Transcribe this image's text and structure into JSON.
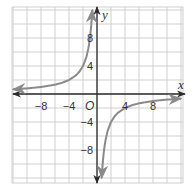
{
  "chart_data": {
    "type": "line",
    "title": "",
    "xlabel": "x",
    "ylabel": "y",
    "origin_label": "O",
    "xlim": [
      -12,
      12.3
    ],
    "ylim": [
      -12.7,
      12.4
    ],
    "grid": true,
    "grid_step": 2,
    "x_ticks": [
      -8,
      -4,
      4,
      8
    ],
    "y_ticks": [
      8,
      4,
      -4,
      -8
    ],
    "x_tick_labels": [
      "−8",
      "−4",
      "4",
      "8"
    ],
    "y_tick_labels": [
      "8",
      "4",
      "−4",
      "−8"
    ],
    "function": "y = -8/x",
    "series": [
      {
        "name": "left-branch",
        "x": [
          -12,
          -10,
          -8,
          -6,
          -5,
          -4,
          -3,
          -2.5,
          -2,
          -1.5,
          -1.2,
          -1,
          -0.8,
          -0.67
        ],
        "y": [
          0.67,
          0.8,
          1,
          1.33,
          1.6,
          2,
          2.67,
          3.2,
          4,
          5.33,
          6.67,
          8,
          10,
          12
        ],
        "arrows": "both"
      },
      {
        "name": "right-branch",
        "x": [
          0.67,
          0.8,
          1,
          1.2,
          1.5,
          2,
          2.5,
          3,
          4,
          5,
          6,
          8,
          10,
          12
        ],
        "y": [
          -12,
          -10,
          -8,
          -6.67,
          -5.33,
          -4,
          -3.2,
          -2.67,
          -2,
          -1.6,
          -1.33,
          -1,
          -0.8,
          -0.67
        ],
        "arrows": "both"
      }
    ],
    "colors": {
      "curve": "#8a8a8a",
      "axes": "#2b2b2b",
      "grid": "#cfcfcf"
    }
  }
}
